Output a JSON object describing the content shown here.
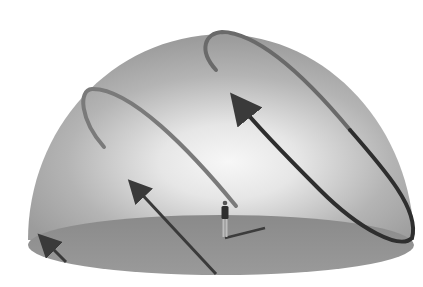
{
  "diagram": {
    "type": "celestial-sky-dome",
    "elements": {
      "dome": "hemisphere",
      "ground": "ground-plane-disc",
      "observer": "human-figure",
      "shadow": "observer-shadow",
      "sun_paths": [
        "short-arc-left-top",
        "medium-arc-left",
        "long-arc-right"
      ],
      "direction_arrows": 4
    },
    "colors": {
      "background": "#ffffff",
      "dome_edge": "#9a9a9a",
      "dome_center": "#f4f4f4",
      "ground": "#8e8e8e",
      "path_light": "#6e6e6e",
      "path_dark": "#2e2e2e",
      "arrow": "#3a3a3a"
    }
  }
}
